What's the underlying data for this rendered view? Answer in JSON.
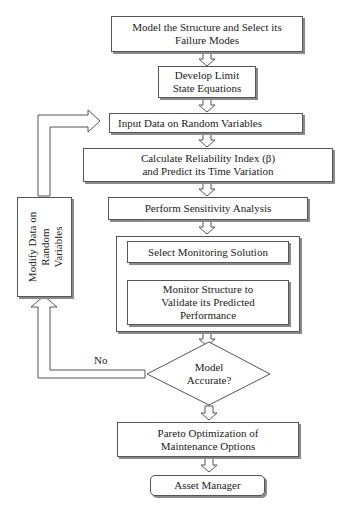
{
  "diagram": {
    "type": "flowchart",
    "steps": [
      {
        "id": "model",
        "lines": [
          "Model the Structure and Select its",
          "Failure Modes"
        ]
      },
      {
        "id": "limit",
        "lines": [
          "Develop Limit",
          "State Equations"
        ]
      },
      {
        "id": "input",
        "lines": [
          "Input Data on Random Variables"
        ]
      },
      {
        "id": "reliability",
        "lines": [
          "Calculate Reliability Index (β)",
          "and Predict its Time Variation"
        ]
      },
      {
        "id": "sensitivity",
        "lines": [
          "Perform Sensitivity Analysis"
        ]
      },
      {
        "id": "select_monitoring",
        "lines": [
          "Select Monitoring Solution"
        ]
      },
      {
        "id": "monitor",
        "lines": [
          "Monitor Structure to",
          "Validate its Predicted",
          "Performance"
        ]
      },
      {
        "id": "pareto",
        "lines": [
          "Pareto Optimization of",
          "Maintenance Options"
        ]
      },
      {
        "id": "asset",
        "lines": [
          "Asset Manager"
        ]
      }
    ],
    "decision": {
      "id": "accurate",
      "lines": [
        "Model",
        "Accurate?"
      ],
      "no_label": "No"
    },
    "feedback": {
      "id": "modify",
      "lines": [
        "Modify Data on",
        "Random",
        "Variables"
      ]
    },
    "edges": [
      {
        "from": "model",
        "to": "limit"
      },
      {
        "from": "limit",
        "to": "input"
      },
      {
        "from": "input",
        "to": "reliability"
      },
      {
        "from": "reliability",
        "to": "sensitivity"
      },
      {
        "from": "sensitivity",
        "to": "select_monitoring"
      },
      {
        "from": "select_monitoring",
        "to": "monitor"
      },
      {
        "from": "monitor",
        "to": "accurate"
      },
      {
        "from": "accurate",
        "to": "pareto",
        "label": ""
      },
      {
        "from": "accurate",
        "to": "modify",
        "label": "No"
      },
      {
        "from": "modify",
        "to": "input"
      },
      {
        "from": "pareto",
        "to": "asset"
      }
    ]
  }
}
